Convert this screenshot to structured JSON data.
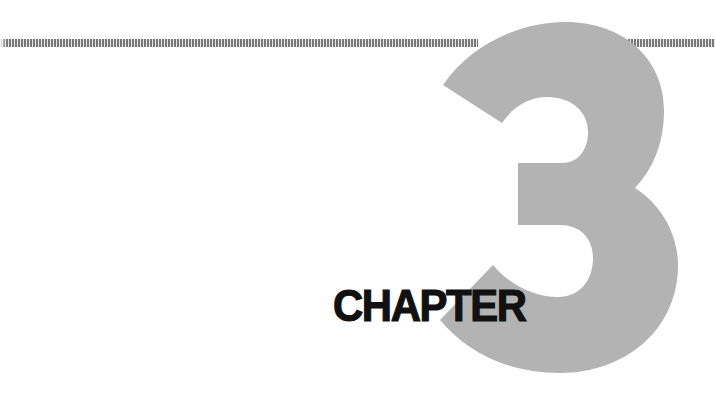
{
  "page": {
    "type": "chapter-opener",
    "chapter_label": "CHAPTER",
    "chapter_number": "3"
  },
  "colors": {
    "numeral_fill": "#b3b3b3",
    "label_text": "#111111",
    "rule": "#6a6a6a",
    "background": "#ffffff"
  },
  "decorations": {
    "top_rule": "dashed-tick-rule"
  }
}
